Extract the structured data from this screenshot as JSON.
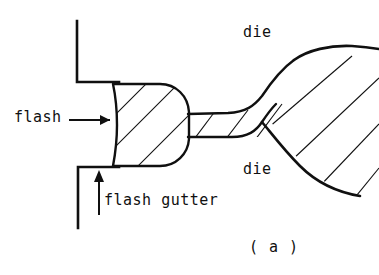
{
  "figure": {
    "caption": "( a )",
    "background_color": "#ffffff",
    "line_color": "#101010"
  },
  "labels": {
    "flash": "flash",
    "flash_gutter": "flash gutter",
    "die_top": "die",
    "die_bottom": "die"
  },
  "annotations": {
    "flash_arrow": "arrow pointing right from flash label to flash body",
    "gutter_arrow": "arrow pointing up from flash gutter label to gutter surface"
  },
  "geometry": {
    "upper_die": {
      "vertical_x": 77,
      "vertical_y_top": 21,
      "vertical_y_bottom": 82,
      "horizontal_y": 82,
      "horizontal_x_end": 118
    },
    "lower_die": {
      "horizontal_y": 167,
      "horizontal_x_start": 78,
      "vertical_x": 78,
      "vertical_y_bottom": 228
    },
    "flash_bulb": {
      "left_x": 112,
      "right_x": 188,
      "top_y": 83,
      "bottom_y": 167
    },
    "neck_channel": {
      "top_y": 114,
      "bottom_y": 136,
      "x_start": 188,
      "x_end": 280
    },
    "workpiece_right": {
      "flare_start_x": 262,
      "right_edge_x": 379,
      "top_y_at_edge": 50,
      "bottom_y_at_edge": 195
    },
    "hatch_angle_degrees": 45
  }
}
